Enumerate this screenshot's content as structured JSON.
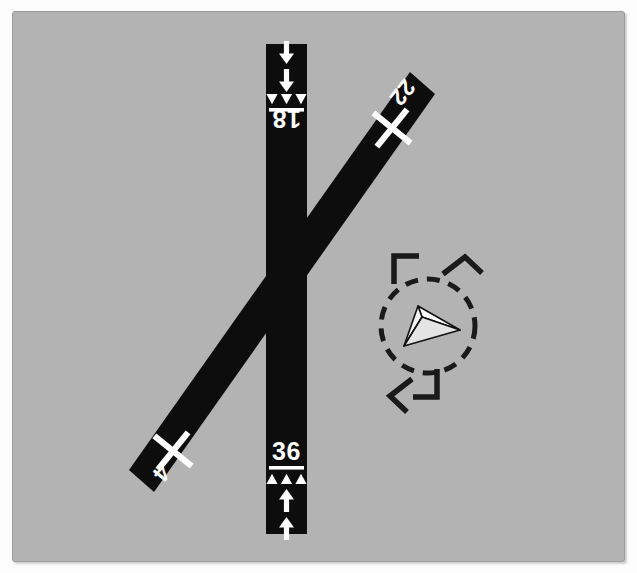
{
  "figure": {
    "kind": "airport-diagram",
    "background_color": "#b3b3b3",
    "pavement_color": "#0d0d0d",
    "marking_color": "#ffffff",
    "page_color": "#fdfdfd",
    "border_color": "#9a9a9a"
  },
  "panel": {
    "x": 12,
    "y": 11,
    "width": 613,
    "height": 551
  },
  "runways": [
    {
      "name": "runway-18-36",
      "orientation": "vertical",
      "status": "open",
      "x": 265,
      "y": 43,
      "width": 41,
      "height": 490,
      "ends": [
        {
          "designator": "18",
          "position": "north",
          "rotation": 180,
          "label_x": 285,
          "label_y": 124,
          "threshold_bar_y": 108,
          "threshold_arrowheads": 3,
          "approach_arrows": 2
        },
        {
          "designator": "36",
          "position": "south",
          "rotation": 0,
          "label_x": 285,
          "label_y": 450,
          "threshold_bar_y": 464,
          "threshold_arrowheads": 3,
          "approach_arrows": 2
        }
      ]
    },
    {
      "name": "runway-4-22",
      "orientation": "diagonal",
      "status": "closed",
      "angle_deg": -51,
      "ends": [
        {
          "designator": "22",
          "position": "northeast",
          "label_x": 401,
          "label_y": 98,
          "closed_x_center_x": 391,
          "closed_x_center_y": 127,
          "rotation": 129
        },
        {
          "designator": "4",
          "position": "southwest",
          "label_x": 160,
          "label_y": 473,
          "closed_x_center_x": 172,
          "closed_x_center_y": 450,
          "rotation": 129
        }
      ]
    }
  ],
  "segmented_circle": {
    "name": "segmented-circle",
    "center_x": 427,
    "center_y": 325,
    "radius": 47,
    "dash_color": "#1a1a1a",
    "dash_length": 13,
    "dash_gap": 9,
    "stroke_width": 5,
    "traffic_pattern_legs": [
      {
        "name": "leg-northwest",
        "angle_deg": 225
      },
      {
        "name": "leg-northeast",
        "angle_deg": 315
      },
      {
        "name": "leg-southwest",
        "angle_deg": 135
      },
      {
        "name": "leg-southeast",
        "angle_deg": 45
      }
    ],
    "wind_indicator": {
      "name": "tetrahedron-wind-indicator",
      "type": "tetrahedron",
      "points_toward": "east",
      "fill": "#ffffff",
      "stroke": "#111111"
    }
  }
}
